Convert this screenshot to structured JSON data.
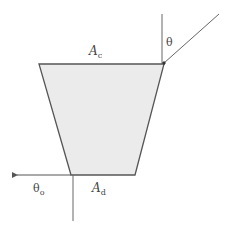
{
  "figure": {
    "type": "concentrator-trapezoid-schematic",
    "colors": {
      "background": "#ffffff",
      "fill": "#ebebeb",
      "outline": "#555555",
      "ray": "#666666",
      "text": "#444444"
    },
    "shape": {
      "name": "trapezoid",
      "top_left": [
        39,
        64
      ],
      "top_right": [
        164,
        64
      ],
      "bottom_right": [
        135,
        175
      ],
      "bottom_left": [
        71,
        175
      ]
    },
    "labels": {
      "top_aperture": {
        "main": "A",
        "sub": "c"
      },
      "bottom_aperture": {
        "main": "A",
        "sub": "d"
      },
      "input_angle": {
        "main": "θ",
        "sub": ""
      },
      "output_angle": {
        "main": "θ",
        "sub": "o"
      }
    }
  }
}
